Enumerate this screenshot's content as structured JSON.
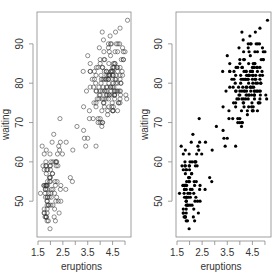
{
  "chart_data": [
    {
      "type": "scatter",
      "panel": "left",
      "marker": "open-circle",
      "title": "",
      "xlabel": "eruptions",
      "ylabel": "waiting",
      "xlim": [
        1.46,
        5.24
      ],
      "ylim": [
        40.9,
        98.1
      ],
      "xticks": [
        1.5,
        2.0,
        2.5,
        3.0,
        3.5,
        4.0,
        4.5,
        5.0
      ],
      "xtick_labels": [
        "1.5",
        "",
        "2.5",
        "",
        "3.5",
        "",
        "4.5",
        ""
      ],
      "yticks": [
        50,
        60,
        70,
        80,
        90
      ],
      "ytick_labels": [
        "50",
        "60",
        "70",
        "80",
        "90"
      ],
      "grid": false,
      "legend": null
    },
    {
      "type": "scatter",
      "panel": "right",
      "marker": "filled-circle",
      "title": "",
      "xlabel": "eruptions",
      "ylabel": "waiting",
      "xlim": [
        1.46,
        5.24
      ],
      "ylim": [
        40.9,
        98.1
      ],
      "xticks": [
        1.5,
        2.0,
        2.5,
        3.0,
        3.5,
        4.0,
        4.5,
        5.0
      ],
      "xtick_labels": [
        "1.5",
        "",
        "2.5",
        "",
        "3.5",
        "",
        "4.5",
        ""
      ],
      "yticks": [
        50,
        60,
        70,
        80,
        90
      ],
      "ytick_labels": [
        "50",
        "60",
        "70",
        "80",
        "90"
      ],
      "grid": false,
      "legend": null
    }
  ],
  "data": {
    "eruptions": [
      3.6,
      1.8,
      3.333,
      2.283,
      4.533,
      2.883,
      4.7,
      3.6,
      1.95,
      4.35,
      1.833,
      3.917,
      4.2,
      1.75,
      4.7,
      2.167,
      1.75,
      4.8,
      1.6,
      4.25,
      1.8,
      1.75,
      3.45,
      3.067,
      4.533,
      3.6,
      1.967,
      4.083,
      3.85,
      4.433,
      4.3,
      4.467,
      3.367,
      4.033,
      3.833,
      2.017,
      1.867,
      4.833,
      1.833,
      4.783,
      4.35,
      1.883,
      4.567,
      1.75,
      4.533,
      3.317,
      3.833,
      2.1,
      4.633,
      2,
      4.8,
      4.716,
      1.833,
      4.833,
      1.733,
      4.883,
      3.717,
      1.667,
      4.567,
      4.317,
      2.233,
      4.5,
      1.75,
      4.8,
      1.817,
      4.4,
      4.167,
      4.7,
      2.067,
      4.7,
      4.033,
      1.967,
      4.5,
      4,
      1.983,
      5.067,
      2.017,
      4.567,
      3.883,
      3.6,
      4.133,
      4.333,
      4.1,
      2.633,
      4.067,
      4.933,
      3.95,
      4.517,
      2.167,
      4,
      2.2,
      4.333,
      1.867,
      4.817,
      1.833,
      4.3,
      4.667,
      3.75,
      1.867,
      4.9,
      2.483,
      4.367,
      2.1,
      4.5,
      4.05,
      1.867,
      4.7,
      1.783,
      4.85,
      3.683,
      4.733,
      2.3,
      4.9,
      4.417,
      1.7,
      4.633,
      2.317,
      4.6,
      1.817,
      4.417,
      2.617,
      4.067,
      4.25,
      1.967,
      4.6,
      3.767,
      1.917,
      4.5,
      2.267,
      4.65,
      1.867,
      4.167,
      2.8,
      4.333,
      1.833,
      4.383,
      1.883,
      4.933,
      2.033,
      3.733,
      4.233,
      2.233,
      4.533,
      4.817,
      4.333,
      1.983,
      4.633,
      2.017,
      5.1,
      1.8,
      5.033,
      4,
      2.4,
      4.6,
      3.567,
      4,
      4.5,
      4.083,
      1.8,
      3.967,
      2.2,
      4.15,
      2,
      3.833,
      3.5,
      4.583,
      2.367,
      5,
      1.933,
      4.617,
      1.917,
      2.083,
      4.583,
      3.333,
      4.167,
      4.333,
      4.5,
      2.417,
      4,
      4.167,
      1.883,
      4.583,
      4.25,
      3.767,
      2.033,
      4.433,
      4.083,
      1.833,
      4.417,
      2.183,
      4.8,
      1.833,
      4.8,
      4.1,
      3.966,
      4.233,
      3.5,
      4.366,
      2.25,
      4.667,
      2.1,
      4.35,
      4.133,
      1.867,
      4.6,
      1.783,
      4.367,
      3.85,
      1.933,
      4.5,
      2.383,
      4.7,
      1.867,
      3.833,
      3.417,
      4.233,
      2.4,
      4.8,
      2,
      4.15,
      1.867,
      4.267,
      1.75,
      4.483,
      4,
      4.117,
      4.083,
      4.267,
      3.917,
      4.55,
      4.083,
      2.417,
      4.183,
      2.217,
      4.45,
      1.883,
      1.85,
      4.283,
      3.95,
      2.333,
      4.15,
      2.35,
      4.933,
      2.9,
      4.583,
      3.833,
      2.083,
      4.367,
      2.133,
      4.35,
      2.2,
      4.45,
      3.567,
      4.5,
      4.15,
      3.817,
      3.917,
      4.45,
      2,
      4.283,
      4.767,
      4.533,
      1.85,
      4.25,
      1.983,
      2.25,
      4.75,
      4.117,
      2.15,
      4.417,
      1.817,
      4.467
    ],
    "waiting": [
      79,
      54,
      74,
      62,
      85,
      55,
      88,
      85,
      51,
      85,
      54,
      84,
      78,
      47,
      83,
      52,
      62,
      84,
      52,
      79,
      51,
      47,
      78,
      69,
      74,
      83,
      55,
      76,
      78,
      79,
      73,
      77,
      66,
      80,
      74,
      52,
      48,
      80,
      59,
      90,
      80,
      58,
      84,
      58,
      73,
      83,
      64,
      53,
      82,
      59,
      75,
      90,
      54,
      80,
      54,
      83,
      71,
      64,
      77,
      81,
      59,
      84,
      48,
      82,
      60,
      92,
      78,
      78,
      65,
      73,
      82,
      56,
      79,
      71,
      62,
      76,
      60,
      78,
      76,
      83,
      75,
      82,
      70,
      65,
      73,
      88,
      76,
      80,
      48,
      86,
      60,
      90,
      50,
      78,
      63,
      72,
      84,
      75,
      51,
      82,
      62,
      88,
      49,
      83,
      81,
      47,
      84,
      52,
      86,
      81,
      75,
      59,
      89,
      79,
      59,
      81,
      50,
      85,
      59,
      87,
      53,
      69,
      77,
      56,
      88,
      81,
      45,
      82,
      55,
      90,
      45,
      83,
      56,
      89,
      46,
      82,
      51,
      86,
      53,
      79,
      81,
      60,
      82,
      77,
      76,
      59,
      80,
      49,
      96,
      53,
      77,
      77,
      65,
      81,
      71,
      70,
      81,
      93,
      53,
      89,
      45,
      86,
      58,
      78,
      66,
      76,
      63,
      88,
      52,
      93,
      49,
      57,
      77,
      68,
      81,
      81,
      73,
      50,
      85,
      74,
      55,
      77,
      83,
      83,
      51,
      78,
      84,
      46,
      83,
      55,
      81,
      57,
      76,
      84,
      77,
      81,
      87,
      77,
      51,
      78,
      60,
      82,
      91,
      53,
      78,
      46,
      77,
      84,
      49,
      83,
      71,
      80,
      49,
      75,
      64,
      76,
      53,
      94,
      55,
      76,
      50,
      82,
      54,
      75,
      78,
      79,
      78,
      78,
      70,
      79,
      70,
      54,
      86,
      50,
      90,
      54,
      54,
      77,
      79,
      64,
      75,
      47,
      86,
      63,
      85,
      82,
      57,
      82,
      67,
      74,
      54,
      83,
      73,
      73,
      88,
      80,
      71,
      83,
      56,
      79,
      78,
      84,
      58,
      83,
      43,
      60,
      75,
      81,
      46,
      90,
      46,
      74
    ]
  }
}
